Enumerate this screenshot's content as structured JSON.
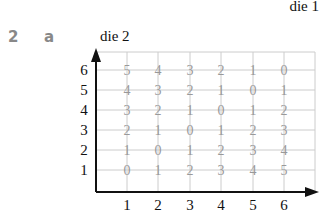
{
  "header": {
    "corner_label": "die 1",
    "question_number": "2",
    "part_label": "a"
  },
  "diagram": {
    "y_axis_title": "die 2",
    "x_axis_label": "die 1",
    "x_ticks": [
      "1",
      "2",
      "3",
      "4",
      "5",
      "6"
    ],
    "y_ticks": [
      "1",
      "2",
      "3",
      "4",
      "5",
      "6"
    ],
    "grid_values": [
      [
        "5",
        "4",
        "3",
        "2",
        "1",
        "0"
      ],
      [
        "4",
        "3",
        "2",
        "1",
        "0",
        "1"
      ],
      [
        "3",
        "2",
        "1",
        "0",
        "1",
        "2"
      ],
      [
        "2",
        "1",
        "0",
        "1",
        "2",
        "3"
      ],
      [
        "1",
        "0",
        "1",
        "2",
        "3",
        "4"
      ],
      [
        "0",
        "1",
        "2",
        "3",
        "4",
        "5"
      ]
    ],
    "grid_values_row_order": "top row is die 2 = 6, bottom row is die 2 = 1",
    "colors": {
      "axis": "#111111",
      "grid": "#cccccc",
      "values": "#999999",
      "ticks": "#111111"
    }
  }
}
